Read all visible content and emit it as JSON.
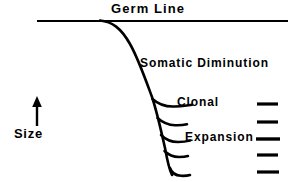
{
  "figure": {
    "background_color": "#ffffff",
    "stroke_color": "#000000",
    "labels": {
      "germ_line": "Germ Line",
      "somatic_diminution": "Somatic Diminution",
      "clonal": "Clonal",
      "expansion": "Expansion",
      "size_axis": "Size"
    },
    "axis": {
      "name": "size-axis",
      "direction": "up",
      "label": "Size"
    },
    "germ_line_path": {
      "name": "germ-line-horizontal",
      "start_x": 37,
      "end_x": 288,
      "y": 21
    },
    "descending_curve": {
      "name": "somatic-diminution-curve",
      "top_x": 108,
      "top_y": 21,
      "bottom_x": 172,
      "bottom_y": 175
    },
    "branches": [
      {
        "name": "branch-1",
        "y": 104,
        "x_start": 163,
        "x_end": 192
      },
      {
        "name": "branch-2",
        "y": 123,
        "x_start": 166,
        "x_end": 186
      },
      {
        "name": "branch-3",
        "y": 140,
        "x_start": 168,
        "x_end": 188
      },
      {
        "name": "branch-4",
        "y": 155,
        "x_start": 170,
        "x_end": 186
      },
      {
        "name": "branch-5",
        "y": 174,
        "x_start": 172,
        "x_end": 190
      }
    ],
    "right_dashes": [
      {
        "name": "dash-1",
        "y": 104,
        "x_start": 257,
        "x_end": 278
      },
      {
        "name": "dash-2",
        "y": 122,
        "x_start": 257,
        "x_end": 278
      },
      {
        "name": "dash-3",
        "y": 139,
        "x_start": 256,
        "x_end": 280
      },
      {
        "name": "dash-4",
        "y": 155,
        "x_start": 257,
        "x_end": 278
      },
      {
        "name": "dash-5",
        "y": 172,
        "x_start": 257,
        "x_end": 279
      }
    ]
  }
}
